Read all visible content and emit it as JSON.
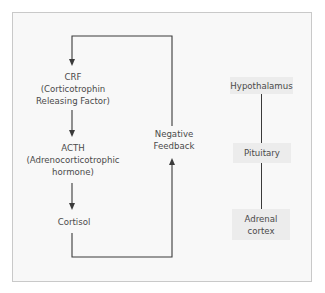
{
  "diagram": {
    "type": "hormone-feedback-loop",
    "cascade": [
      {
        "id": "crf",
        "lines": [
          "CRF",
          "(Corticotrophin",
          "Releasing Factor)"
        ]
      },
      {
        "id": "acth",
        "lines": [
          "ACTH",
          "(Adrenocorticotrophic",
          "hormone)"
        ]
      },
      {
        "id": "cortisol",
        "lines": [
          "Cortisol"
        ]
      }
    ],
    "feedback": {
      "lines": [
        "Negative",
        "Feedback"
      ]
    },
    "organs": [
      {
        "id": "hypothalamus",
        "lines": [
          "Hypothalamus"
        ]
      },
      {
        "id": "pituitary",
        "lines": [
          "Pituitary"
        ]
      },
      {
        "id": "adrenal-cortex",
        "lines": [
          "Adrenal",
          "cortex"
        ]
      }
    ],
    "edges": [
      {
        "from": "negative-feedback",
        "to": "crf",
        "style": "arrow"
      },
      {
        "from": "crf",
        "to": "acth",
        "style": "arrow"
      },
      {
        "from": "acth",
        "to": "cortisol",
        "style": "arrow"
      },
      {
        "from": "cortisol",
        "to": "negative-feedback",
        "style": "arrow"
      },
      {
        "from": "hypothalamus",
        "to": "pituitary",
        "style": "line"
      },
      {
        "from": "pituitary",
        "to": "adrenal-cortex",
        "style": "line"
      }
    ],
    "colors": {
      "line": "#3a3a3a",
      "text": "#4a4a4a",
      "frame_border": "#c9c9c9",
      "frame_bg": "#f8f8f8",
      "organ_box_bg": "#ececec"
    }
  }
}
